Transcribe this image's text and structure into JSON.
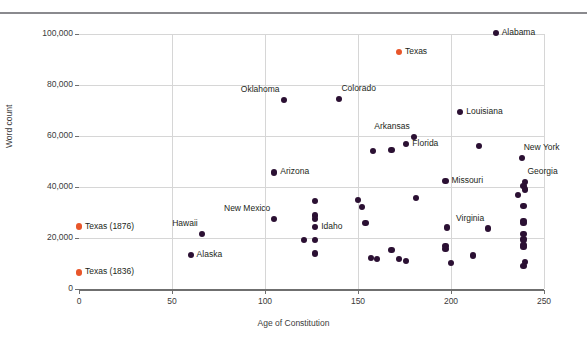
{
  "figure": {
    "top_rule": true,
    "background": "#ffffff",
    "point_color": "#2b1033",
    "highlight_color": "#e8562a",
    "grid_color": "#d6d6d6",
    "axis_color": "#6f6f6f"
  },
  "chart_data": {
    "type": "scatter",
    "title": "",
    "xlabel": "Age of Constitution",
    "ylabel": "Word count",
    "xlim": [
      0,
      250
    ],
    "ylim": [
      0,
      100000
    ],
    "xticks": [
      "0",
      "50",
      "100",
      "150",
      "200",
      "250"
    ],
    "xtick_values": [
      0,
      50,
      100,
      150,
      200,
      250
    ],
    "yticks": [
      "0",
      "20,000",
      "40,000",
      "60,000",
      "80,000",
      "100,000"
    ],
    "ytick_values": [
      0,
      20000,
      40000,
      60000,
      80000,
      100000
    ],
    "grid": "both",
    "legend": "none",
    "series": [
      {
        "name": "States",
        "color": "#2b1033",
        "points": [
          {
            "label": "Alabama",
            "x": 224,
            "y": 100400,
            "label_pos": "right"
          },
          {
            "label": "Oklahoma",
            "x": 110,
            "y": 74000,
            "label_pos": "above-left"
          },
          {
            "label": "Colorado",
            "x": 140,
            "y": 74500,
            "label_pos": "above-right"
          },
          {
            "label": "Louisiana",
            "x": 205,
            "y": 69500,
            "label_pos": "right"
          },
          {
            "label": "Arkansas",
            "x": 180,
            "y": 59500,
            "label_pos": "above-left"
          },
          {
            "label": "Florida",
            "x": 176,
            "y": 56800,
            "label_pos": "right"
          },
          {
            "label": "New York",
            "x": 238,
            "y": 51500,
            "label_pos": "above-right"
          },
          {
            "label": "Georgia",
            "x": 240,
            "y": 41800,
            "label_pos": "above-right"
          },
          {
            "label": "Missouri",
            "x": 197,
            "y": 42500,
            "label_pos": "right"
          },
          {
            "label": "Arizona",
            "x": 105,
            "y": 45700,
            "label_pos": "right"
          },
          {
            "label": "New Mexico",
            "x": 105,
            "y": 27400,
            "label_pos": "above-left"
          },
          {
            "label": "Idaho",
            "x": 127,
            "y": 24200,
            "label_pos": "right"
          },
          {
            "label": "Hawaii",
            "x": 66,
            "y": 21500,
            "label_pos": "above-left"
          },
          {
            "label": "Alaska",
            "x": 60,
            "y": 13300,
            "label_pos": "right"
          },
          {
            "label": "Virginia",
            "x": 220,
            "y": 23700,
            "label_pos": "above-left"
          },
          {
            "label": "",
            "x": 158,
            "y": 54100
          },
          {
            "label": "",
            "x": 168,
            "y": 54600
          },
          {
            "label": "",
            "x": 215,
            "y": 56000
          },
          {
            "label": "",
            "x": 181,
            "y": 35800
          },
          {
            "label": "",
            "x": 150,
            "y": 35000
          },
          {
            "label": "",
            "x": 152,
            "y": 32000
          },
          {
            "label": "",
            "x": 154,
            "y": 26000
          },
          {
            "label": "",
            "x": 127,
            "y": 34500
          },
          {
            "label": "",
            "x": 127,
            "y": 28800
          },
          {
            "label": "",
            "x": 127,
            "y": 27600
          },
          {
            "label": "",
            "x": 121,
            "y": 19300
          },
          {
            "label": "",
            "x": 127,
            "y": 19200
          },
          {
            "label": "",
            "x": 127,
            "y": 13900
          },
          {
            "label": "",
            "x": 157,
            "y": 12100
          },
          {
            "label": "",
            "x": 160,
            "y": 11900
          },
          {
            "label": "",
            "x": 168,
            "y": 15300
          },
          {
            "label": "",
            "x": 172,
            "y": 11700
          },
          {
            "label": "",
            "x": 176,
            "y": 11000
          },
          {
            "label": "",
            "x": 198,
            "y": 24100
          },
          {
            "label": "",
            "x": 197,
            "y": 16800
          },
          {
            "label": "",
            "x": 197,
            "y": 15800
          },
          {
            "label": "",
            "x": 200,
            "y": 10200
          },
          {
            "label": "",
            "x": 212,
            "y": 13100
          },
          {
            "label": "",
            "x": 236,
            "y": 36800
          },
          {
            "label": "",
            "x": 239,
            "y": 40300
          },
          {
            "label": "",
            "x": 240,
            "y": 39000
          },
          {
            "label": "",
            "x": 239,
            "y": 32500
          },
          {
            "label": "",
            "x": 239,
            "y": 26800
          },
          {
            "label": "",
            "x": 239,
            "y": 25800
          },
          {
            "label": "",
            "x": 239,
            "y": 21700
          },
          {
            "label": "",
            "x": 239,
            "y": 19400
          },
          {
            "label": "",
            "x": 239,
            "y": 17400
          },
          {
            "label": "",
            "x": 239,
            "y": 16600
          },
          {
            "label": "",
            "x": 240,
            "y": 10500
          },
          {
            "label": "",
            "x": 239,
            "y": 9000
          }
        ]
      },
      {
        "name": "Texas",
        "color": "#e8562a",
        "points": [
          {
            "label": "Texas",
            "x": 172,
            "y": 93000,
            "label_pos": "right"
          },
          {
            "label": "Texas (1876)",
            "x": 0,
            "y": 24500,
            "label_pos": "right"
          },
          {
            "label": "Texas (1836)",
            "x": 0,
            "y": 6500,
            "label_pos": "right"
          }
        ]
      }
    ]
  }
}
